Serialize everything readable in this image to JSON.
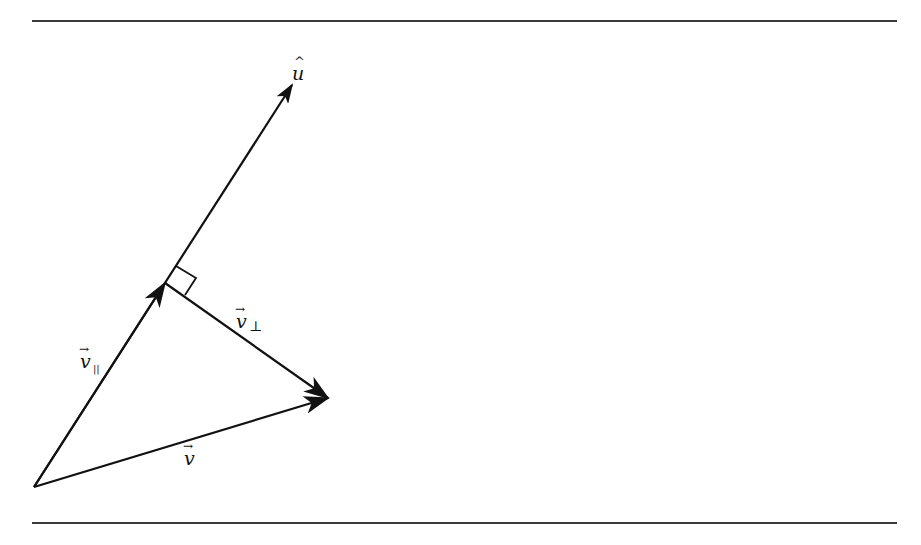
{
  "figure": {
    "type": "vector-projection-diagram",
    "stroke_color": "#111111",
    "rule_color": "#3a3a3a"
  },
  "labels": {
    "u_hat": {
      "base": "u",
      "accent": "^"
    },
    "v": {
      "base": "v",
      "accent": "→"
    },
    "v_parallel": {
      "base": "v",
      "accent": "→",
      "subscript": "||"
    },
    "v_perp": {
      "base": "v",
      "accent": "→",
      "subscript": "⊥"
    }
  },
  "vectors": [
    {
      "name": "u-hat",
      "from": [
        34,
        487
      ],
      "to": [
        292,
        85
      ]
    },
    {
      "name": "v-parallel",
      "from": [
        34,
        487
      ],
      "to": [
        165,
        283
      ]
    },
    {
      "name": "v",
      "from": [
        34,
        487
      ],
      "to": [
        328,
        398
      ]
    },
    {
      "name": "v-perp",
      "from": [
        165,
        283
      ],
      "to": [
        328,
        398
      ]
    }
  ],
  "right_angle_marker": {
    "at": [
      165,
      283
    ],
    "size": 20
  }
}
